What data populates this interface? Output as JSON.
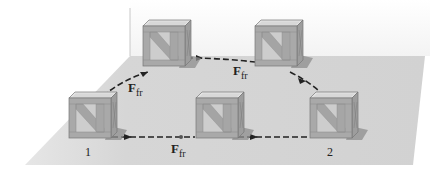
{
  "figure": {
    "labels": {
      "force_symbol": "F",
      "force_subscript": "fr",
      "position_start": "1",
      "position_end": "2"
    },
    "force_labels": [
      {
        "id": "ffr-curved-left",
        "text": "F",
        "sub": "fr"
      },
      {
        "id": "ffr-curved-top",
        "text": "F",
        "sub": "fr"
      },
      {
        "id": "ffr-straight",
        "text": "F",
        "sub": "fr"
      }
    ],
    "paths": [
      {
        "name": "curved-path",
        "style": "dashed",
        "via": "two raised crate positions"
      },
      {
        "name": "straight-path",
        "style": "dashed",
        "via": "one middle crate position"
      }
    ],
    "colors": {
      "floor": "#d4d4d4",
      "crate_frame": "#a8a8a8",
      "crate_panel": "#c9c9c9",
      "crate_top": "#e2e2e2",
      "shadow": "#8c8c8c",
      "path": "#222222"
    }
  }
}
